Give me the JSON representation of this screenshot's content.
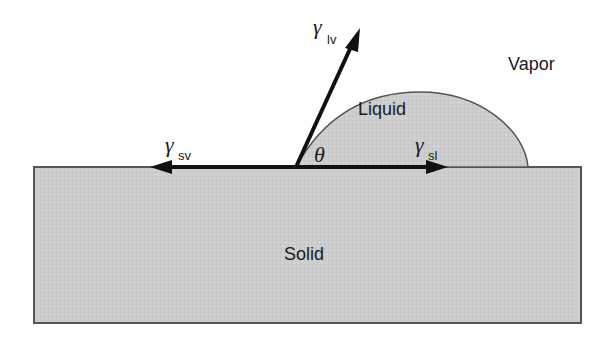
{
  "diagram": {
    "regions": {
      "vapor": "Vapor",
      "liquid": "Liquid",
      "solid": "Solid"
    },
    "angle_symbol": "θ",
    "vectors": [
      {
        "id": "lv",
        "symbol": "γ",
        "subscript": "lv",
        "direction": "up-right along liquid-vapor interface"
      },
      {
        "id": "sv",
        "symbol": "γ",
        "subscript": "sv",
        "direction": "left along solid surface"
      },
      {
        "id": "sl",
        "symbol": "γ",
        "subscript": "sl",
        "direction": "right along solid surface"
      }
    ],
    "colors": {
      "solid_fill": "#cfcfcf",
      "liquid_fill": "#d4d4d4",
      "outline": "#555555",
      "vector": "#111111"
    }
  }
}
